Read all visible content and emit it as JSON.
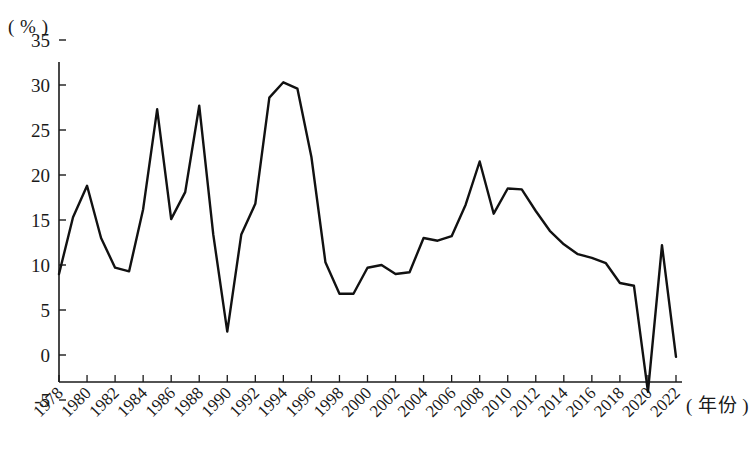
{
  "chart_data": {
    "type": "line",
    "title": "",
    "subtitle": "",
    "unit_label": "( % )",
    "xlabel": "( 年份 )",
    "ylabel": "",
    "ylim": [
      -5,
      35
    ],
    "xlim": [
      1978,
      2022
    ],
    "ytick_labels": [
      "35",
      "30",
      "25",
      "20",
      "15",
      "10",
      "5",
      "0",
      "-5"
    ],
    "ytick_values": [
      35,
      30,
      25,
      20,
      15,
      10,
      5,
      0,
      -5
    ],
    "xtick_labels": [
      "1978",
      "1980",
      "1982",
      "1984",
      "1986",
      "1988",
      "1990",
      "1992",
      "1994",
      "1996",
      "1998",
      "2000",
      "2002",
      "2004",
      "2006",
      "2008",
      "2010",
      "2012",
      "2014",
      "2016",
      "2018",
      "2020",
      "2022"
    ],
    "xtick_values": [
      1978,
      1980,
      1982,
      1984,
      1986,
      1988,
      1990,
      1992,
      1994,
      1996,
      1998,
      2000,
      2002,
      2004,
      2006,
      2008,
      2010,
      2012,
      2014,
      2016,
      2018,
      2020,
      2022
    ],
    "xtick_rotation_deg": 45,
    "grid": false,
    "legend": false,
    "legend_position": "none",
    "line_color": "#111111",
    "line_width_px": 2.4,
    "x": [
      1978,
      1979,
      1980,
      1981,
      1982,
      1983,
      1984,
      1985,
      1986,
      1987,
      1988,
      1989,
      1990,
      1991,
      1992,
      1993,
      1994,
      1995,
      1996,
      1997,
      1998,
      1999,
      2000,
      2001,
      2002,
      2003,
      2004,
      2005,
      2006,
      2007,
      2008,
      2009,
      2010,
      2011,
      2012,
      2013,
      2014,
      2015,
      2016,
      2017,
      2018,
      2019,
      2020,
      2021,
      2022
    ],
    "series": [
      {
        "name": "年增长率",
        "values": [
          9.0,
          15.3,
          18.8,
          13.0,
          9.7,
          9.3,
          16.2,
          27.3,
          15.1,
          18.1,
          27.7,
          13.4,
          2.6,
          13.4,
          16.8,
          28.6,
          30.3,
          29.6,
          22.0,
          10.3,
          6.8,
          6.8,
          9.7,
          10.0,
          9.0,
          9.2,
          13.0,
          12.7,
          13.2,
          16.7,
          21.5,
          15.7,
          18.5,
          18.4,
          16.0,
          13.8,
          12.3,
          11.2,
          10.8,
          10.2,
          8.0,
          7.7,
          -4.1,
          12.2,
          -0.2
        ]
      }
    ],
    "annotations": []
  },
  "geometry": {
    "plot_left": 59,
    "plot_right": 676,
    "y_zero_px": 355,
    "px_per_unit": 9.0,
    "axis_top_px": 62,
    "axis_bottom_px": 382
  }
}
